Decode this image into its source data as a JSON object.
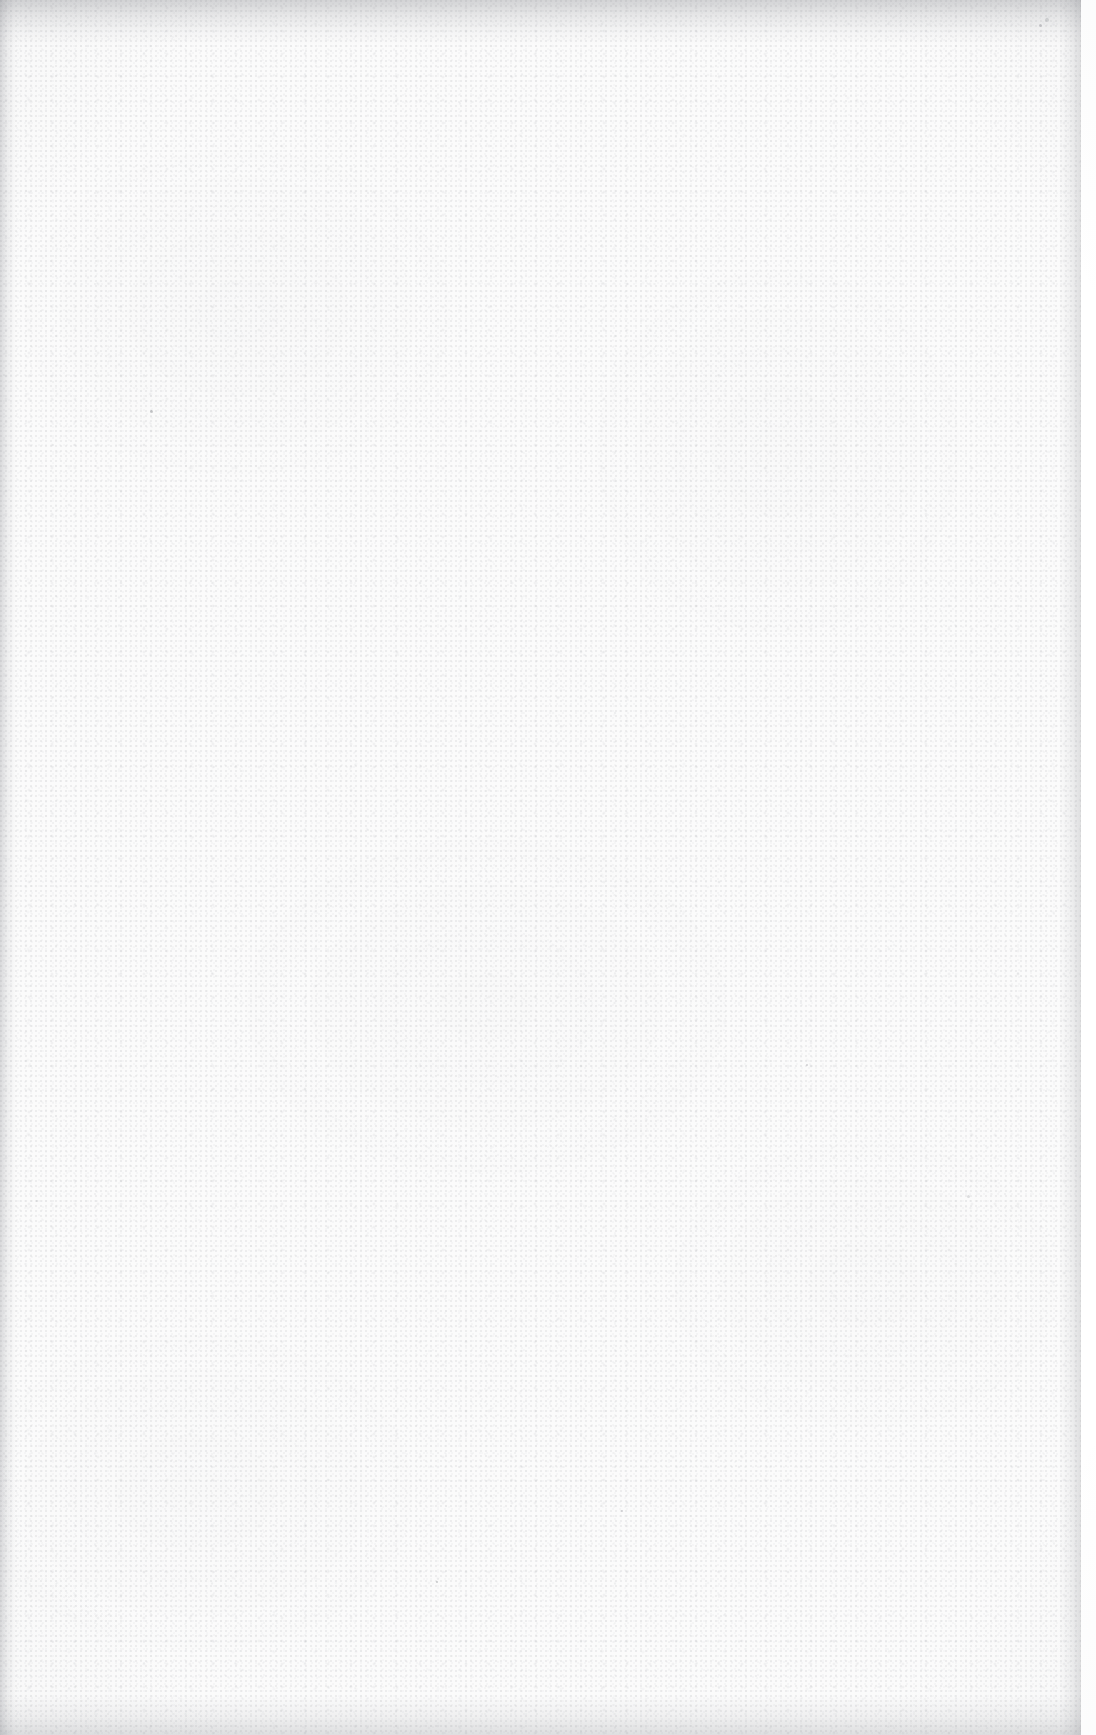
{
  "page": {
    "kind": "blank-scanned-page",
    "orientation": "portrait",
    "width_px": 1096,
    "height_px": 1735,
    "text_content": "",
    "visible_text_elements": []
  },
  "colors": {
    "scan_background": "#fdfdfd",
    "paper_fill": "#fbfbfb",
    "scanner_backing": "#ffffff",
    "grain_tone": "#7e8086",
    "edge_shadow": "#76787e"
  },
  "paper": {
    "right_edge_x_px": 1081,
    "has_top_edge_shadow": true,
    "has_left_edge_line": true,
    "has_bottom_edge_shadow": true,
    "has_right_paper_edge": true
  },
  "blemishes": [
    {
      "x": 1045,
      "y": 18,
      "size": 4
    },
    {
      "x": 1039,
      "y": 24,
      "size": 3
    },
    {
      "x": 150,
      "y": 410,
      "size": 3
    },
    {
      "x": 967,
      "y": 1195,
      "size": 3
    },
    {
      "x": 806,
      "y": 1064,
      "size": 2
    },
    {
      "x": 436,
      "y": 1581,
      "size": 2
    },
    {
      "x": 36,
      "y": 1200,
      "size": 2
    },
    {
      "x": 621,
      "y": 1510,
      "size": 2
    }
  ]
}
